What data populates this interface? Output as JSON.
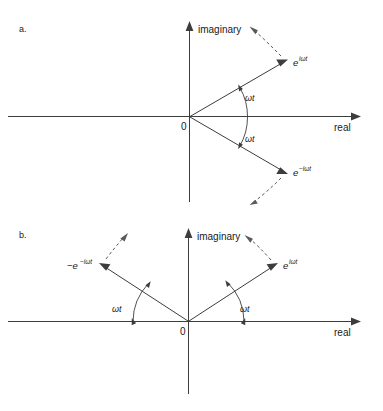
{
  "figure": {
    "background_color": "#ffffff",
    "line_color": "#3d3d3d",
    "dashed_color": "#5a5a5a",
    "text_color": "#1a1a1a"
  },
  "panels": [
    {
      "letter": "a.",
      "axes": {
        "imaginary_label": "imaginary",
        "real_label": "real",
        "origin_label": "0"
      },
      "vectors": [
        {
          "name": "e-plus-i-omega-t",
          "base": "e",
          "exponent": "iωt",
          "label": "e^{iωt}",
          "angle_deg": 30,
          "rotation": "counter-clockwise"
        },
        {
          "name": "e-minus-i-omega-t",
          "base": "e",
          "exponent": "−iωt",
          "label": "e^{−iωt}",
          "angle_deg": -30,
          "rotation": "clockwise"
        }
      ],
      "angle_labels": [
        "ωt",
        "ωt"
      ]
    },
    {
      "letter": "b.",
      "axes": {
        "imaginary_label": "imaginary",
        "real_label": "real",
        "origin_label": "0"
      },
      "vectors": [
        {
          "name": "minus-e-minus-i-omega-t",
          "base": "−e",
          "exponent": "−iωt",
          "label": "−e^{−iωt}",
          "angle_deg": 145,
          "rotation": "counter-clockwise"
        },
        {
          "name": "e-plus-i-omega-t",
          "base": "e",
          "exponent": "iωt",
          "label": "e^{iωt}",
          "angle_deg": 35,
          "rotation": "clockwise"
        }
      ],
      "angle_labels": [
        "ωt",
        "ωt"
      ]
    }
  ]
}
